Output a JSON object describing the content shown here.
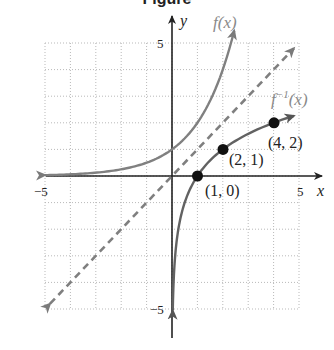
{
  "header": {
    "title_fragment": "Figure"
  },
  "chart_data": {
    "type": "line",
    "title": "",
    "xlabel": "x",
    "ylabel": "y",
    "xlim": [
      -5,
      5
    ],
    "ylim": [
      -5,
      5
    ],
    "grid": true,
    "x_ticks_labeled": [
      {
        "value": -5,
        "label": "−5"
      },
      {
        "value": 5,
        "label": "5"
      }
    ],
    "y_ticks_labeled": [
      {
        "value": 5,
        "label": "5"
      },
      {
        "value": -5,
        "label": "−5"
      }
    ],
    "series": [
      {
        "name": "f(x)",
        "function": "2^x",
        "style": "solid",
        "color": "#7f7f7f",
        "arrows": "both",
        "x_range": [
          -5,
          2.45
        ]
      },
      {
        "name": "f⁻¹(x)",
        "function": "log2(x)",
        "style": "solid",
        "color": "#6b6b6b",
        "arrows": "both",
        "x_range": [
          0.03,
          4.8
        ]
      },
      {
        "name": "y = x",
        "function": "x",
        "style": "dashed",
        "color": "#7f7f7f",
        "arrows": "both",
        "x_range": [
          -4.8,
          4.8
        ]
      }
    ],
    "points": [
      {
        "x": 1,
        "y": 0,
        "label": "(1, 0)"
      },
      {
        "x": 2,
        "y": 1,
        "label": "(2, 1)"
      },
      {
        "x": 4,
        "y": 2,
        "label": "(4, 2)"
      }
    ],
    "annotations": [
      {
        "text": "f(x)",
        "near": "top of f(x) curve"
      },
      {
        "text": "f⁻¹(x)",
        "near": "right end of inverse curve"
      }
    ]
  },
  "labels": {
    "x_axis": "x",
    "y_axis": "y",
    "x_neg5": "−5",
    "x_pos5": "5",
    "y_pos5": "5",
    "y_neg5": "−5",
    "f_label": "f(x)",
    "finv_label_base": "f",
    "finv_label_sup": "−1",
    "finv_label_arg": "(x)",
    "p1": "(1, 0)",
    "p2": "(2, 1)",
    "p3": "(4, 2)"
  }
}
